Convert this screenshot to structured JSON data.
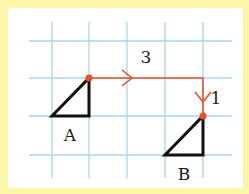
{
  "diagram": {
    "type": "grid-translation",
    "colors": {
      "frame": "#fdf7a8",
      "panel": "#ffffff",
      "grid": "#a8d4e8",
      "shape": "#111111",
      "path": "#e8502a"
    },
    "grid": {
      "vertical_x": [
        52,
        89,
        127,
        165,
        203
      ],
      "horizontal_y": [
        41,
        78,
        116,
        155
      ],
      "x_extent": [
        29,
        232
      ],
      "y_extent": [
        22,
        178
      ]
    },
    "shapes": [
      {
        "name": "A",
        "label": "A",
        "points": "52,116 89,116 89,78",
        "label_pos": [
          70,
          141
        ]
      },
      {
        "name": "B",
        "label": "B",
        "points": "165,155 203,155 203,116",
        "label_pos": [
          184,
          180
        ]
      }
    ],
    "translation": {
      "path": "89,78 203,78 203,116",
      "start_point": [
        89,
        78
      ],
      "end_point": [
        203,
        116
      ],
      "steps": [
        {
          "label": "3",
          "direction": "right",
          "label_pos": [
            146,
            63
          ]
        },
        {
          "label": "1",
          "direction": "down",
          "label_pos": [
            216,
            104
          ]
        }
      ]
    }
  }
}
